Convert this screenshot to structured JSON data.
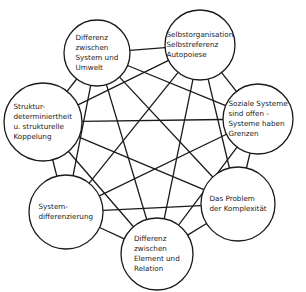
{
  "diagram": {
    "type": "complete-graph",
    "colors": {
      "stroke": "#1a1a1a",
      "fill": "#ffffff",
      "background": "#ffffff"
    },
    "nodes": [
      {
        "id": "n1",
        "lines": [
          "Differenz",
          "zwischen",
          "System und",
          "Umwelt"
        ],
        "cx": 97,
        "cy": 53,
        "r": 33
      },
      {
        "id": "n2",
        "lines": [
          "Selbstorganisation",
          "Selbstreferenz",
          "Autopoiese"
        ],
        "cx": 200,
        "cy": 45,
        "r": 35
      },
      {
        "id": "n3",
        "lines": [
          "Soziale Systeme",
          "sind offen -",
          "Systeme haben",
          "Grenzen"
        ],
        "cx": 258,
        "cy": 119,
        "r": 35
      },
      {
        "id": "n4",
        "lines": [
          "Das Problem",
          "der Komplexität"
        ],
        "cx": 238,
        "cy": 204,
        "r": 37
      },
      {
        "id": "n5",
        "lines": [
          "Differenz",
          "zwischen",
          "Element und",
          "Relation"
        ],
        "cx": 157,
        "cy": 254,
        "r": 36
      },
      {
        "id": "n6",
        "lines": [
          "System-",
          "differenzierung"
        ],
        "cx": 66,
        "cy": 212,
        "r": 37
      },
      {
        "id": "n7",
        "lines": [
          "Struktur-",
          "determiniertheit",
          "u. strukturelle",
          "Koppelung"
        ],
        "cx": 43,
        "cy": 122,
        "r": 39
      }
    ],
    "edges": "all-pairs"
  }
}
